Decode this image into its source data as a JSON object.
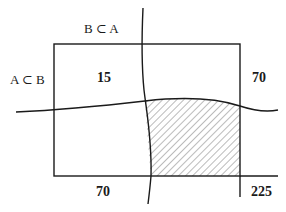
{
  "diagram": {
    "labels": {
      "top_label": "B ⊂ A",
      "left_label": "A ⊂ B",
      "top_left_value": "15",
      "top_right_value": "70",
      "bottom_left_value": "70",
      "bottom_right_value": "225"
    },
    "colors": {
      "line": "#1a1a1a",
      "hatch": "#555555",
      "background": "#ffffff"
    },
    "shaded_region": "bottom-right quadrant (hatched)"
  }
}
